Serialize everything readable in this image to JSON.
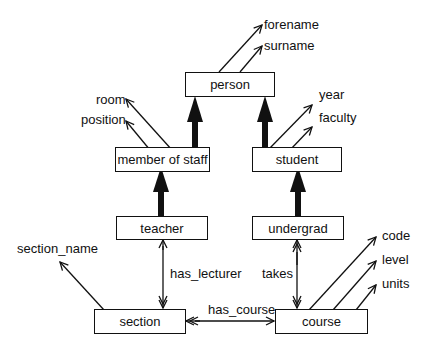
{
  "diagram": {
    "entities": {
      "person": "person",
      "member_of_staff": "member of staff",
      "student": "student",
      "teacher": "teacher",
      "undergrad": "undergrad",
      "section": "section",
      "course": "course"
    },
    "attributes": {
      "forename": "forename",
      "surname": "surname",
      "room": "room",
      "position": "position",
      "year": "year",
      "faculty": "faculty",
      "section_name": "section_name",
      "code": "code",
      "level": "level",
      "units": "units"
    },
    "relationships": {
      "has_lecturer": "has_lecturer",
      "takes": "takes",
      "has_course": "has_course"
    },
    "edges": [
      {
        "from": "member of staff",
        "to": "person",
        "type": "isa"
      },
      {
        "from": "student",
        "to": "person",
        "type": "isa"
      },
      {
        "from": "teacher",
        "to": "member of staff",
        "type": "isa"
      },
      {
        "from": "undergrad",
        "to": "student",
        "type": "isa"
      },
      {
        "from": "teacher",
        "to": "section",
        "label": "has_lecturer",
        "type": "one-to-many"
      },
      {
        "from": "undergrad",
        "to": "course",
        "label": "takes",
        "type": "many-to-many"
      },
      {
        "from": "section",
        "to": "course",
        "label": "has_course",
        "type": "many-to-one"
      }
    ]
  }
}
